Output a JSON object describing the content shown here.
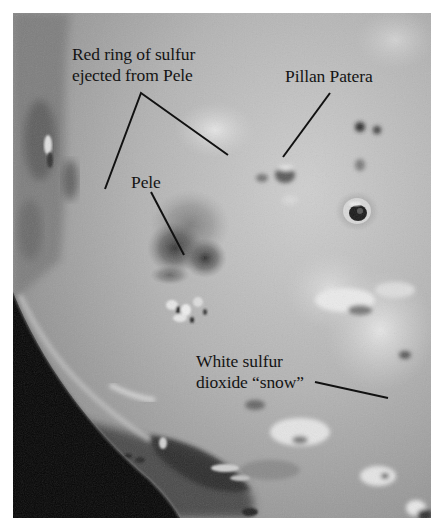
{
  "figure": {
    "labels": [
      {
        "id": "red-ring",
        "lines": [
          "Red ring of sulfur",
          "ejected from Pele"
        ]
      },
      {
        "id": "pillan",
        "lines": [
          "Pillan Patera"
        ]
      },
      {
        "id": "pele",
        "lines": [
          "Pele"
        ]
      },
      {
        "id": "snow",
        "lines": [
          "White sulfur",
          "dioxide “snow”"
        ]
      }
    ]
  },
  "colors": {
    "background": "#ffffff",
    "surface_mid": "#a8a8a8",
    "space": "#050505",
    "text": "#141414"
  }
}
